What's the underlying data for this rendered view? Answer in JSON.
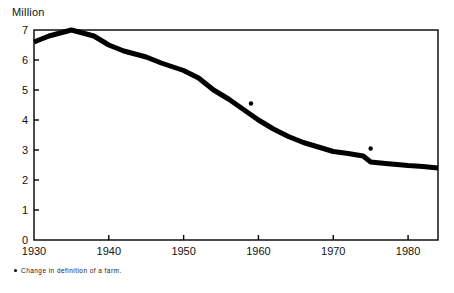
{
  "figure": {
    "unit_caption": "Million",
    "footnote_text": "Change in definition of a farm.",
    "footnote_marker": "change-marker-dot"
  },
  "chart_data": {
    "type": "line",
    "title": "",
    "subtitle": "",
    "xlabel": "",
    "ylabel": "Million",
    "xlim": [
      1930,
      1984
    ],
    "ylim": [
      0,
      7
    ],
    "grid": false,
    "legend": "none",
    "x_ticks": [
      1930,
      1940,
      1950,
      1960,
      1970,
      1980
    ],
    "x_tick_labels": [
      "1930",
      "1940",
      "1950",
      "1960",
      "1970",
      "1980"
    ],
    "y_ticks": [
      0,
      1,
      2,
      3,
      4,
      5,
      6,
      7
    ],
    "y_tick_labels": [
      "0",
      "1",
      "2",
      "3",
      "4",
      "5",
      "6",
      "7"
    ],
    "series": [
      {
        "name": "Number of farms",
        "color": "#000000",
        "line_width": 5,
        "x": [
          1930,
          1932,
          1935,
          1938,
          1940,
          1942,
          1945,
          1947,
          1950,
          1952,
          1954,
          1956,
          1958,
          1960,
          1962,
          1964,
          1966,
          1968,
          1970,
          1972,
          1974,
          1975,
          1977,
          1980,
          1982,
          1984
        ],
        "values": [
          6.6,
          6.8,
          7.0,
          6.8,
          6.5,
          6.3,
          6.1,
          5.9,
          5.65,
          5.4,
          5.0,
          4.7,
          4.35,
          4.0,
          3.7,
          3.45,
          3.25,
          3.1,
          2.95,
          2.88,
          2.8,
          2.6,
          2.55,
          2.48,
          2.45,
          2.4
        ]
      }
    ],
    "annotations": [
      {
        "name": "definition-change-1959",
        "x": 1959,
        "y": 4.55,
        "marker": "dot",
        "label": ""
      },
      {
        "name": "definition-change-1975",
        "x": 1975,
        "y": 3.05,
        "marker": "dot",
        "label": ""
      }
    ],
    "notes": [
      "Change in definition of a farm."
    ]
  },
  "axis": {
    "frame_color": "#000000",
    "tick_color": "#000000"
  }
}
